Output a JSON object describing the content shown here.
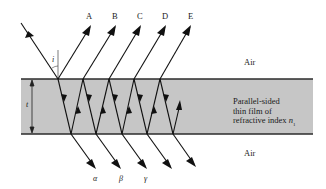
{
  "figure": {
    "colors": {
      "film_fill": "#c6c6c6",
      "film_border": "#2b2b2b",
      "ray": "#111111",
      "background": "#ffffff"
    },
    "labels": {
      "reflected": [
        "A",
        "B",
        "C",
        "D",
        "E"
      ],
      "transmitted": [
        "α",
        "β",
        "γ"
      ],
      "air_top": "Air",
      "air_bottom": "Air",
      "film_line1": "Parallel-sided",
      "film_line2": "thin film of",
      "film_line3": "refractive index",
      "film_index_symbol": "n",
      "film_index_subscript": "1",
      "thickness_symbol": "t",
      "angle_symbol": "i"
    }
  }
}
